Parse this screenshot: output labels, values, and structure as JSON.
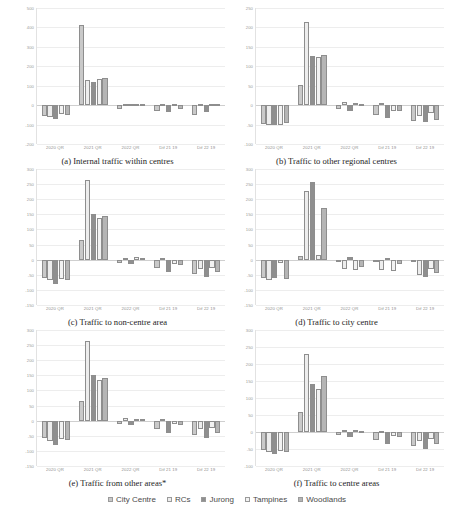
{
  "figure": {
    "series_names": [
      "City Centre",
      "RCs",
      "Jurong",
      "Tampines",
      "Woodlands"
    ],
    "series_colors": [
      "#c9c9c9",
      "#ededed",
      "#8f8f8f",
      "#f2f2f2",
      "#b5b5b5"
    ],
    "categories": [
      "2020 QR",
      "2021 QR",
      "2022 QR",
      "Dif 21 19",
      "Dif 22 19"
    ]
  },
  "legend": {
    "items": [
      {
        "label": "City Centre",
        "color": "#c9c9c9"
      },
      {
        "label": "RCs",
        "color": "#ededed"
      },
      {
        "label": "Jurong",
        "color": "#8f8f8f"
      },
      {
        "label": "Tampines",
        "color": "#f2f2f2"
      },
      {
        "label": "Woodlands",
        "color": "#b5b5b5"
      }
    ]
  },
  "chart_data": [
    {
      "id": "a",
      "type": "bar",
      "title": "(a) Internal traffic within centres",
      "caption": "(a) Internal traffic within centres",
      "xlabel": "",
      "ylabel": "",
      "ylim": [
        -200,
        500
      ],
      "yticks": [
        500,
        400,
        300,
        200,
        100,
        0,
        -100,
        -200
      ],
      "grid": true,
      "legend_position": "bottom-shared",
      "categories": [
        "2020 QR",
        "2021 QR",
        "2022 QR",
        "Dif 21 19",
        "Dif 22 19"
      ],
      "series": [
        {
          "name": "City Centre",
          "values": [
            -58,
            412,
            -18,
            -30,
            -50
          ]
        },
        {
          "name": "RCs",
          "values": [
            -60,
            128,
            6,
            6,
            4
          ]
        },
        {
          "name": "Jurong",
          "values": [
            -72,
            118,
            8,
            -36,
            -34
          ]
        },
        {
          "name": "Tampines",
          "values": [
            -44,
            132,
            6,
            4,
            6
          ]
        },
        {
          "name": "Woodlands",
          "values": [
            -52,
            140,
            4,
            -20,
            6
          ]
        }
      ]
    },
    {
      "id": "b",
      "type": "bar",
      "title": "(b) Traffic to other regional centres",
      "caption": "(b) Traffic to other regional centres",
      "xlabel": "",
      "ylabel": "",
      "ylim": [
        -100,
        250
      ],
      "yticks": [
        250,
        200,
        150,
        100,
        50,
        0,
        -50,
        -100
      ],
      "grid": true,
      "legend_position": "bottom-shared",
      "categories": [
        "2020 QR",
        "2021 QR",
        "2022 QR",
        "Dif 21 19",
        "Dif 22 19"
      ],
      "series": [
        {
          "name": "City Centre",
          "values": [
            -48,
            52,
            -10,
            -26,
            -42
          ]
        },
        {
          "name": "RCs",
          "values": [
            -50,
            214,
            8,
            6,
            -28
          ]
        },
        {
          "name": "Jurong",
          "values": [
            -52,
            126,
            -14,
            -34,
            -44
          ]
        },
        {
          "name": "Tampines",
          "values": [
            -50,
            124,
            6,
            -16,
            -20
          ]
        },
        {
          "name": "Woodlands",
          "values": [
            -46,
            128,
            4,
            -14,
            -38
          ]
        }
      ]
    },
    {
      "id": "c",
      "type": "bar",
      "title": "(c) Traffic to non-centre area",
      "caption": "(c) Traffic to non-centre area",
      "xlabel": "",
      "ylabel": "",
      "ylim": [
        -150,
        300
      ],
      "yticks": [
        300,
        250,
        200,
        150,
        100,
        50,
        0,
        -50,
        -100,
        -150
      ],
      "grid": true,
      "legend_position": "bottom-shared",
      "categories": [
        "2020 QR",
        "2021 QR",
        "2022 QR",
        "Dif 21 19",
        "Dif 22 19"
      ],
      "series": [
        {
          "name": "City Centre",
          "values": [
            -62,
            66,
            -12,
            -28,
            -48
          ]
        },
        {
          "name": "RCs",
          "values": [
            -68,
            262,
            6,
            6,
            -30
          ]
        },
        {
          "name": "Jurong",
          "values": [
            -82,
            150,
            -14,
            -40,
            -56
          ]
        },
        {
          "name": "Tampines",
          "values": [
            -64,
            138,
            8,
            -14,
            -26
          ]
        },
        {
          "name": "Woodlands",
          "values": [
            -66,
            144,
            6,
            -18,
            -42
          ]
        }
      ]
    },
    {
      "id": "d",
      "type": "bar",
      "title": "(d) Traffic to city centre",
      "caption": "(d) Traffic to city centre",
      "xlabel": "",
      "ylabel": "",
      "ylim": [
        -150,
        300
      ],
      "yticks": [
        300,
        250,
        200,
        150,
        100,
        50,
        0,
        -50,
        -100,
        -150
      ],
      "grid": true,
      "legend_position": "bottom-shared",
      "categories": [
        "2020 QR",
        "2021 QR",
        "2022 QR",
        "Dif 21 19",
        "Dif 22 19"
      ],
      "series": [
        {
          "name": "City Centre",
          "values": [
            -62,
            12,
            -4,
            -6,
            -8
          ]
        },
        {
          "name": "RCs",
          "values": [
            -66,
            228,
            -30,
            -34,
            -52
          ]
        },
        {
          "name": "Jurong",
          "values": [
            -60,
            256,
            8,
            6,
            -58
          ]
        },
        {
          "name": "Tampines",
          "values": [
            -12,
            14,
            -34,
            -38,
            -30
          ]
        },
        {
          "name": "Woodlands",
          "values": [
            -64,
            170,
            -24,
            -14,
            -44
          ]
        }
      ]
    },
    {
      "id": "e",
      "type": "bar",
      "title": "(e) Traffic from other areas*",
      "caption": "(e) Traffic from other areas*",
      "xlabel": "",
      "ylabel": "",
      "ylim": [
        -150,
        300
      ],
      "yticks": [
        300,
        250,
        200,
        150,
        100,
        50,
        0,
        -50,
        -100,
        -150
      ],
      "grid": true,
      "legend_position": "bottom-shared",
      "categories": [
        "2020 QR",
        "2021 QR",
        "2022 QR",
        "Dif 21 19",
        "Dif 22 19"
      ],
      "series": [
        {
          "name": "City Centre",
          "values": [
            -58,
            64,
            -10,
            -28,
            -46
          ]
        },
        {
          "name": "RCs",
          "values": [
            -66,
            262,
            8,
            6,
            -28
          ]
        },
        {
          "name": "Jurong",
          "values": [
            -82,
            152,
            -16,
            -42,
            -58
          ]
        },
        {
          "name": "Tampines",
          "values": [
            -62,
            136,
            6,
            -12,
            -24
          ]
        },
        {
          "name": "Woodlands",
          "values": [
            -64,
            140,
            4,
            -16,
            -40
          ]
        }
      ]
    },
    {
      "id": "f",
      "type": "bar",
      "title": "(f) Traffic to centre areas",
      "caption": "(f) Traffic to centre areas",
      "xlabel": "",
      "ylabel": "",
      "ylim": [
        -100,
        300
      ],
      "yticks": [
        300,
        250,
        200,
        150,
        100,
        50,
        0,
        -50,
        -100
      ],
      "grid": true,
      "legend_position": "bottom-shared",
      "categories": [
        "2020 QR",
        "2021 QR",
        "2022 QR",
        "Dif 21 19",
        "Dif 22 19"
      ],
      "series": [
        {
          "name": "City Centre",
          "values": [
            -54,
            58,
            -8,
            -24,
            -40
          ]
        },
        {
          "name": "RCs",
          "values": [
            -58,
            230,
            6,
            4,
            -26
          ]
        },
        {
          "name": "Jurong",
          "values": [
            -66,
            142,
            -14,
            -36,
            -50
          ]
        },
        {
          "name": "Tampines",
          "values": [
            -56,
            126,
            6,
            -12,
            -22
          ]
        },
        {
          "name": "Woodlands",
          "values": [
            -58,
            166,
            4,
            -16,
            -36
          ]
        }
      ]
    }
  ]
}
